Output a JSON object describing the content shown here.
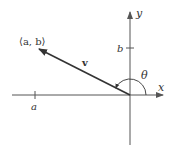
{
  "diagram": {
    "labels": {
      "point": "⟨a, b⟩",
      "vector": "v",
      "angle": "θ",
      "x_axis": "x",
      "y_axis": "y",
      "x_tick": "a",
      "y_tick": "b"
    },
    "colors": {
      "axis": "#555555",
      "vector": "#333333",
      "text": "#333333",
      "background": "#ffffff"
    },
    "geometry": {
      "origin": [
        130,
        95
      ],
      "vector_tip": [
        38,
        49
      ],
      "x_axis_range": [
        12,
        163
      ],
      "y_axis_range": [
        12,
        145
      ],
      "x_tick_pos": 35,
      "y_tick_pos": 48
    }
  }
}
